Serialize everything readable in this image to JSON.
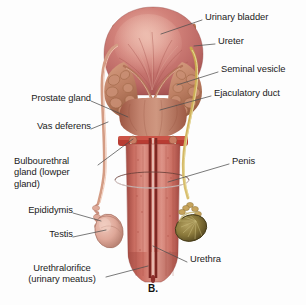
{
  "figure": {
    "caption": "B.",
    "caption_pos": {
      "x": 0,
      "y": 283
    },
    "background_color": "#fdfdfd",
    "text_color": "#1b1b1b",
    "leader_color": "#4a4a4a",
    "width": 306,
    "height": 305
  },
  "palette": {
    "bladder_light": "#d98e85",
    "bladder_mid": "#c4726c",
    "bladder_dark": "#9d4f4d",
    "bladder_highlight": "#e6aaa0",
    "seminal_vesicle": "#c98e73",
    "seminal_vesicle_dark": "#a5674f",
    "prostate": "#bf7d6b",
    "prostate_dark": "#96523f",
    "penis_shaft": "#c96a5f",
    "penis_shaft_dark": "#a34b42",
    "penis_shaft_light": "#dd9086",
    "urethra_line": "#8e2f2b",
    "vas_deferens": "#cf9a82",
    "ureter_yellow": "#cbb04a",
    "testis_left": "#dda99c",
    "testis_left_dark": "#b87a6d",
    "testis_right": "#8d7a3e",
    "testis_right_dark": "#5c4f25",
    "epididymis": "#d9a495",
    "cut_ellipse": "#6b4038"
  },
  "labels": {
    "left": [
      {
        "id": "prostate-gland",
        "text": "Prostate gland",
        "x": 14,
        "y": 97,
        "anchor_x": 91,
        "anchor_y": 101,
        "target_x": 128,
        "target_y": 117
      },
      {
        "id": "vas-deferens",
        "text": "Vas deferens",
        "x": 18,
        "y": 125,
        "anchor_x": 91,
        "anchor_y": 129,
        "target_x": 108,
        "target_y": 122
      },
      {
        "id": "bulbourethral-gland",
        "text": "Bulbourethral\ngland (lowper\ngland)",
        "x": 16,
        "y": 160,
        "anchor_x": 98,
        "anchor_y": 165,
        "target_x": 133,
        "target_y": 135
      },
      {
        "id": "epididymis",
        "text": "Epididymis",
        "x": 14,
        "y": 209,
        "anchor_x": 73,
        "anchor_y": 213,
        "target_x": 101,
        "target_y": 221
      },
      {
        "id": "testis",
        "text": "Testis",
        "x": 38,
        "y": 233,
        "anchor_x": 73,
        "anchor_y": 237,
        "target_x": 106,
        "target_y": 230
      },
      {
        "id": "urethral-orifice",
        "text": "Urethralorifice\n(urinary meatus)",
        "x": 28,
        "y": 267,
        "anchor_x": 106,
        "anchor_y": 277,
        "target_x": 145,
        "target_y": 266
      }
    ],
    "right": [
      {
        "id": "urinary-bladder",
        "text": "Urinary bladder",
        "x": 205,
        "y": 16,
        "anchor_x": 202,
        "anchor_y": 20,
        "target_x": 161,
        "target_y": 34
      },
      {
        "id": "ureter",
        "text": "Ureter",
        "x": 218,
        "y": 40,
        "anchor_x": 215,
        "anchor_y": 44,
        "target_x": 194,
        "target_y": 46
      },
      {
        "id": "seminal-vesicle",
        "text": "Seminal vesicle",
        "x": 221,
        "y": 68,
        "anchor_x": 218,
        "anchor_y": 72,
        "target_x": 177,
        "target_y": 85
      },
      {
        "id": "ejaculatory-duct",
        "text": "Ejaculatory duct",
        "x": 214,
        "y": 92,
        "anchor_x": 211,
        "anchor_y": 96,
        "target_x": 160,
        "target_y": 110
      },
      {
        "id": "penis",
        "text": "Penis",
        "x": 232,
        "y": 160,
        "anchor_x": 229,
        "anchor_y": 164,
        "target_x": 186,
        "target_y": 176
      },
      {
        "id": "urethra",
        "text": "Urethra",
        "x": 190,
        "y": 258,
        "anchor_x": 187,
        "anchor_y": 262,
        "target_x": 153,
        "target_y": 246
      }
    ]
  }
}
